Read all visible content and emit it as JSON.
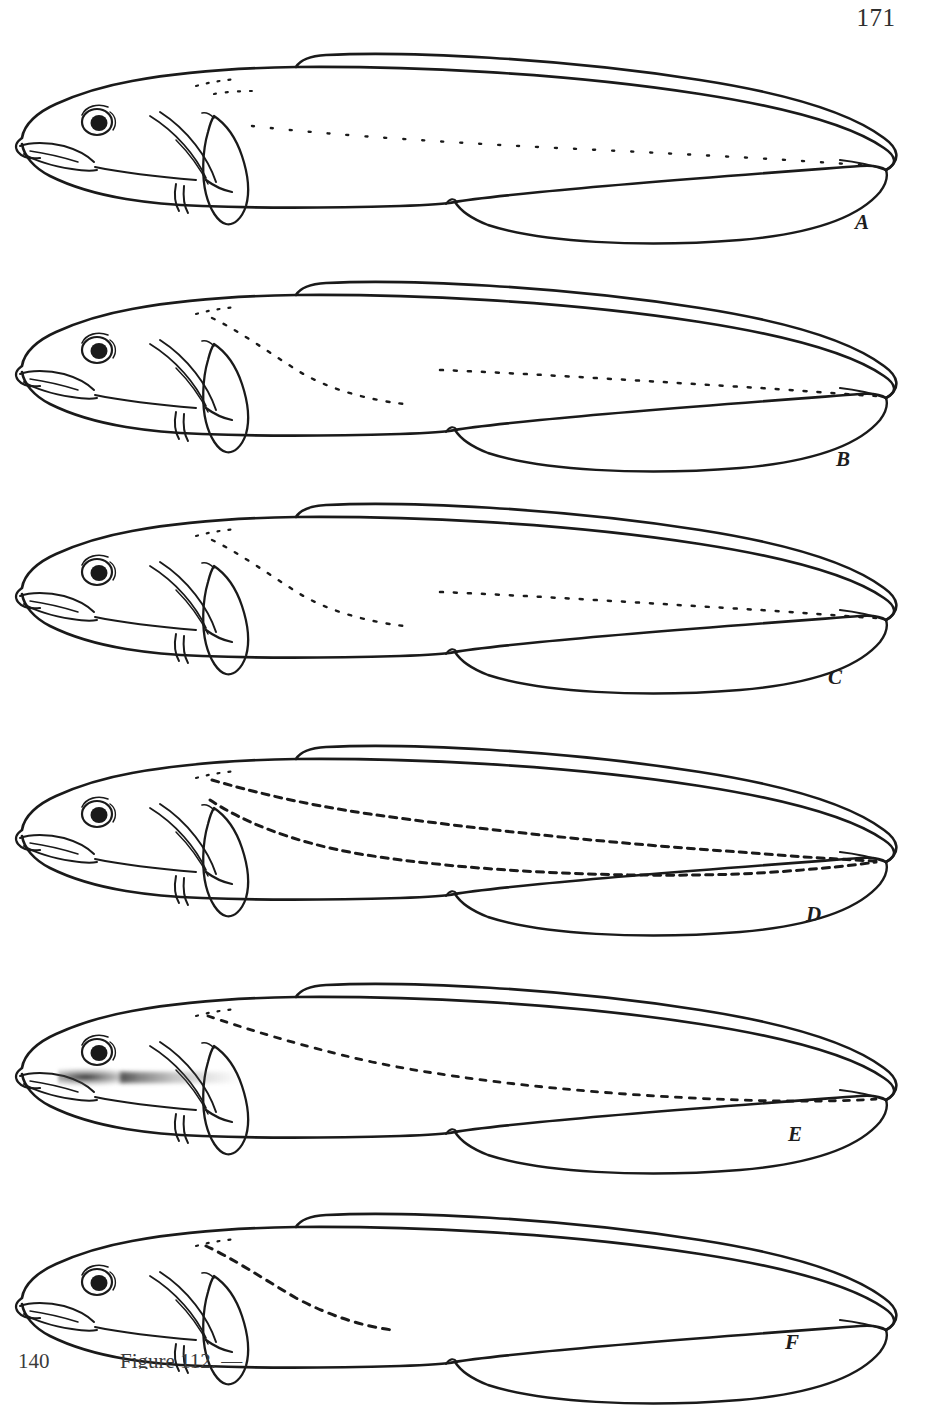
{
  "page": {
    "folio_top": "171",
    "folio_bottom": "140",
    "caption_partial": "Figure 112. — "
  },
  "plate": {
    "title": "",
    "figure_count": 6
  },
  "panels": [
    {
      "id": "A",
      "label": "A",
      "label_x": 855,
      "label_y": 210,
      "top": 20,
      "lateral_line": "sparse fine dots along mid-body, fading anteriorly",
      "dash_style": "fine-dots",
      "notes": "upper lateral line a row of widely spaced dots reaching tail tip"
    },
    {
      "id": "B",
      "label": "B",
      "label_x": 836,
      "label_y": 447,
      "top": 248,
      "lateral_line": "dashed branch descending from nape plus long mid-body dotted line",
      "dash_style": "dots",
      "notes": "ventral branch curves down and ends before mid-body"
    },
    {
      "id": "C",
      "label": "C",
      "label_x": 828,
      "label_y": 665,
      "top": 470,
      "lateral_line": "long descending dotted line with separate upper dotted segment",
      "dash_style": "dots",
      "notes": "two dotted rows converge toward caudal tip"
    },
    {
      "id": "D",
      "label": "D",
      "label_x": 806,
      "label_y": 902,
      "top": 712,
      "lateral_line": "two bold dashed lateral lines running full body length",
      "dash_style": "bold-dashes",
      "notes": "upper and lower branches both reach the caudal tip"
    },
    {
      "id": "E",
      "label": "E",
      "label_x": 788,
      "label_y": 1122,
      "top": 950,
      "lateral_line": "single dashed line from nape descending to mid-body and on to tail",
      "dash_style": "dashes",
      "notes": "scan smudge obscures lower jaw and throat region"
    },
    {
      "id": "F",
      "label": "F",
      "label_x": 785,
      "label_y": 1330,
      "top": 1180,
      "lateral_line": "short dashed line ending at anterior third of body",
      "dash_style": "bold-dashes-short",
      "notes": "lateral line terminates early, well before mid-body"
    }
  ],
  "colors": {
    "ink": "#1a1a1a",
    "paper": "#ffffff",
    "text": "#2e2e2e",
    "smudge": "#2a2a2a"
  }
}
